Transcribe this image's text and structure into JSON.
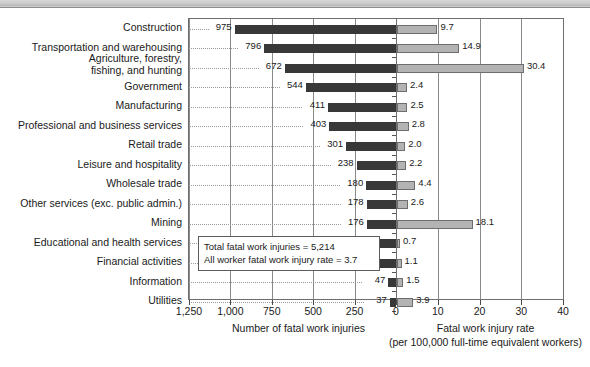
{
  "chart_data": {
    "type": "bar",
    "title": "",
    "orientation": "horizontal",
    "layout": "back-to-back dual axis",
    "grid": true,
    "legend_position": "none",
    "categories": [
      "Construction",
      "Transportation and warehousing",
      "Agriculture, forestry, fishing, and hunting",
      "Government",
      "Manufacturing",
      "Professional and business services",
      "Retail trade",
      "Leisure and hospitality",
      "Wholesale trade",
      "Other services (exc. public admin.)",
      "Mining",
      "Educational and health services",
      "Financial activities",
      "Information",
      "Utilities"
    ],
    "series": [
      {
        "name": "Number of fatal work injuries",
        "axis": "left",
        "axis_direction": "reversed",
        "xlabel": "Number of fatal work injuries",
        "xlim": [
          0,
          1250
        ],
        "ticks": [
          1250,
          1000,
          750,
          500,
          250,
          0
        ],
        "tick_labels": [
          "1,250",
          "1,000",
          "750",
          "500",
          "250",
          "0"
        ],
        "color": "#383838",
        "values": [
          975,
          796,
          672,
          544,
          411,
          403,
          301,
          238,
          180,
          178,
          176,
          141,
          106,
          47,
          37
        ]
      },
      {
        "name": "Fatal work injury rate",
        "axis": "right",
        "xlabel": "Fatal work injury rate",
        "xlabel2": "(per 100,000 full-time equivalent workers)",
        "xlim": [
          0,
          40
        ],
        "ticks": [
          0,
          10,
          20,
          30,
          40
        ],
        "tick_labels": [
          "0",
          "10",
          "20",
          "30",
          "40"
        ],
        "color": "#b3b3b3",
        "values": [
          9.7,
          14.9,
          30.4,
          2.4,
          2.5,
          2.8,
          2.0,
          2.2,
          4.4,
          2.6,
          18.1,
          0.7,
          1.1,
          1.5,
          3.9
        ]
      }
    ]
  },
  "annotation": {
    "line1": "Total fatal work injuries = 5,214",
    "line2": "All worker fatal work injury rate = 3.7"
  },
  "axes": {
    "left": {
      "title": "Number of fatal work injuries",
      "tick_labels": [
        "1,250",
        "1,000",
        "750",
        "500",
        "250",
        "0"
      ]
    },
    "right": {
      "title": "Fatal work injury rate",
      "subtitle": "(per 100,000 full-time equivalent workers)",
      "tick_labels": [
        "0",
        "10",
        "20",
        "30",
        "40"
      ]
    }
  },
  "colors": {
    "bar_left": "#383838",
    "bar_right": "#b3b3b3",
    "frame": "#6e6e6e",
    "grid": "#8a8a8a"
  }
}
